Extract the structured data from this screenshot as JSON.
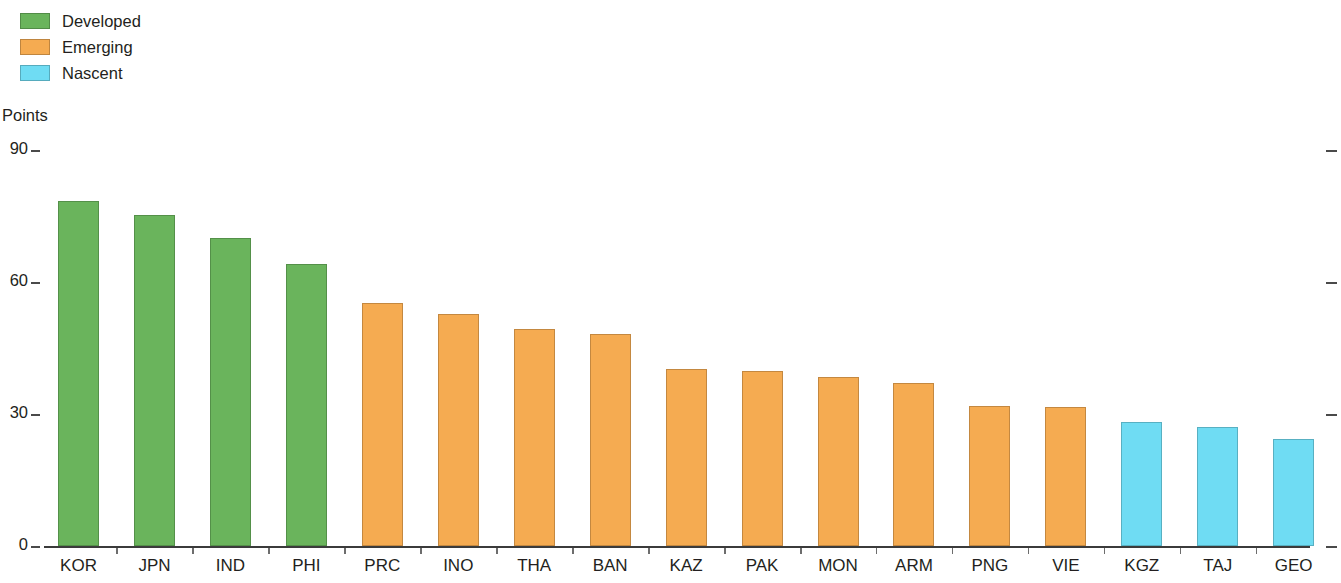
{
  "legend": {
    "items": [
      {
        "label": "Developed",
        "color": "#6ab45c"
      },
      {
        "label": "Emerging",
        "color": "#f5ab51"
      },
      {
        "label": "Nascent",
        "color": "#6fdcf3"
      }
    ]
  },
  "axis": {
    "unit_label": "Points",
    "y_ticks": [
      "90",
      "60",
      "30",
      "0"
    ]
  },
  "chart_data": {
    "type": "bar",
    "title": "",
    "subtitle": "",
    "xlabel": "",
    "ylabel": "Points",
    "ylim": [
      0,
      90
    ],
    "yticks": [
      0,
      30,
      60,
      90
    ],
    "grid": false,
    "legend_position": "top-left",
    "categories": [
      "KOR",
      "JPN",
      "IND",
      "PHI",
      "PRC",
      "INO",
      "THA",
      "BAN",
      "KAZ",
      "PAK",
      "MON",
      "ARM",
      "PNG",
      "VIE",
      "KGZ",
      "TAJ",
      "GEO"
    ],
    "values": [
      78.4,
      75.2,
      70.0,
      64.1,
      55.2,
      52.7,
      49.4,
      48.2,
      40.2,
      39.8,
      38.4,
      37.0,
      31.8,
      31.5,
      28.2,
      27.1,
      24.3
    ],
    "groups": [
      "Developed",
      "Developed",
      "Developed",
      "Developed",
      "Emerging",
      "Emerging",
      "Emerging",
      "Emerging",
      "Emerging",
      "Emerging",
      "Emerging",
      "Emerging",
      "Emerging",
      "Emerging",
      "Nascent",
      "Nascent",
      "Nascent"
    ],
    "group_colors": {
      "Developed": "#6ab45c",
      "Emerging": "#f5ab51",
      "Nascent": "#6fdcf3"
    },
    "series": [
      {
        "name": "Points",
        "values": [
          78.4,
          75.2,
          70.0,
          64.1,
          55.2,
          52.7,
          49.4,
          48.2,
          40.2,
          39.8,
          38.4,
          37.0,
          31.8,
          31.5,
          28.2,
          27.1,
          24.3
        ]
      }
    ]
  }
}
